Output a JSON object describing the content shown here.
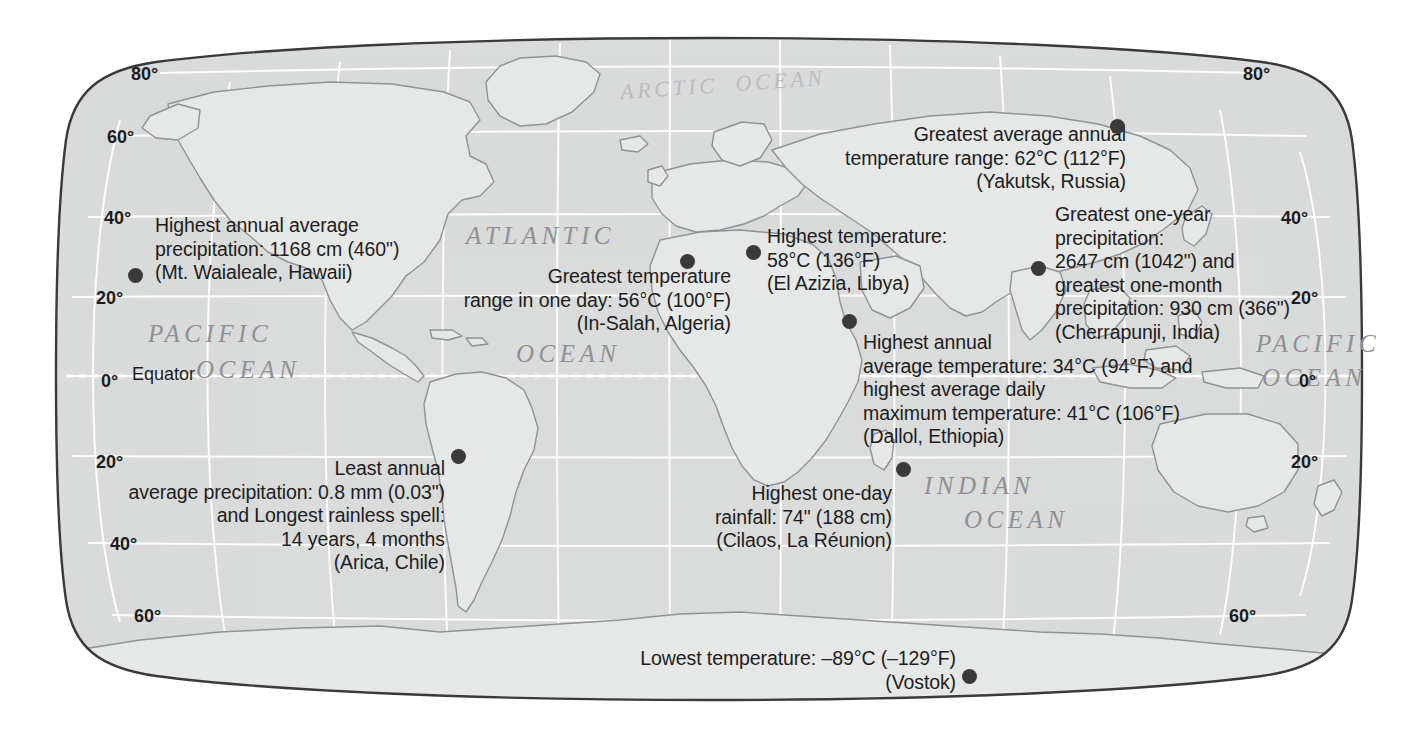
{
  "map": {
    "title": "World Climate Extremes Map",
    "projection": "Robinson",
    "colors": {
      "ocean_fill": "#d7d9da",
      "land_fill": "#e3e4e5",
      "land_stroke": "#9a9da1",
      "graticule": "#ffffff",
      "outline": "#3a3a3a",
      "text": "#1d1d1d",
      "ocean_label": "#8e9195",
      "marker": "#3a3a3a",
      "background": "#ffffff"
    },
    "ocean_labels": [
      {
        "name": "arctic-ocean-label",
        "text": "ARCTIC  OCEAN",
        "x": 620,
        "y": 72,
        "rotate": -4,
        "faint": true,
        "size": "sm"
      },
      {
        "name": "atlantic-ocean-label-line1",
        "text": "ATLANTIC",
        "x": 466,
        "y": 222,
        "rotate": 0,
        "faint": false,
        "size": ""
      },
      {
        "name": "atlantic-ocean-label-line2",
        "text": "OCEAN",
        "x": 516,
        "y": 340,
        "rotate": 0,
        "faint": false,
        "size": ""
      },
      {
        "name": "pacific-ocean-label-line1",
        "text": "PACIFIC",
        "x": 148,
        "y": 320,
        "rotate": 0,
        "faint": false,
        "size": ""
      },
      {
        "name": "pacific-ocean-label-line2",
        "text": "OCEAN",
        "x": 196,
        "y": 356,
        "rotate": 0,
        "faint": false,
        "size": ""
      },
      {
        "name": "pacific-ocean-label-right-line1",
        "text": "PACIFIC",
        "x": 1256,
        "y": 330,
        "rotate": 0,
        "faint": false,
        "size": ""
      },
      {
        "name": "pacific-ocean-label-right-line2",
        "text": "OCEAN",
        "x": 1262,
        "y": 364,
        "rotate": 0,
        "faint": false,
        "size": ""
      },
      {
        "name": "indian-ocean-label-line1",
        "text": "INDIAN",
        "x": 924,
        "y": 472,
        "rotate": 0,
        "faint": false,
        "size": ""
      },
      {
        "name": "indian-ocean-label-line2",
        "text": "OCEAN",
        "x": 964,
        "y": 506,
        "rotate": 0,
        "faint": false,
        "size": ""
      }
    ],
    "latitude_labels": [
      {
        "name": "lat-label-80n-left",
        "text": "80°",
        "x": 131,
        "y": 64
      },
      {
        "name": "lat-label-60n-left",
        "text": "60°",
        "x": 107,
        "y": 127
      },
      {
        "name": "lat-label-40n-left",
        "text": "40°",
        "x": 104,
        "y": 208
      },
      {
        "name": "lat-label-20n-left",
        "text": "20°",
        "x": 96,
        "y": 288
      },
      {
        "name": "lat-label-0-left",
        "text": "0°",
        "x": 101,
        "y": 371
      },
      {
        "name": "lat-label-20s-left",
        "text": "20°",
        "x": 96,
        "y": 452
      },
      {
        "name": "lat-label-40s-left",
        "text": "40°",
        "x": 110,
        "y": 534
      },
      {
        "name": "lat-label-60s-left",
        "text": "60°",
        "x": 134,
        "y": 606
      },
      {
        "name": "lat-label-80n-right",
        "text": "80°",
        "x": 1243,
        "y": 64
      },
      {
        "name": "lat-label-40n-right",
        "text": "40°",
        "x": 1281,
        "y": 208
      },
      {
        "name": "lat-label-20n-right",
        "text": "20°",
        "x": 1291,
        "y": 288
      },
      {
        "name": "lat-label-0-right",
        "text": "0°",
        "x": 1299,
        "y": 371
      },
      {
        "name": "lat-label-20s-right",
        "text": "20°",
        "x": 1291,
        "y": 452
      },
      {
        "name": "lat-label-60s-right",
        "text": "60°",
        "x": 1229,
        "y": 606
      }
    ],
    "equator_label": {
      "name": "equator-label",
      "text": "Equator",
      "x": 132,
      "y": 364
    },
    "markers": [
      {
        "name": "marker-mt-waialeale",
        "x": 135,
        "y": 275
      },
      {
        "name": "marker-arica-chile",
        "x": 458,
        "y": 456
      },
      {
        "name": "marker-in-salah-algeria",
        "x": 687,
        "y": 261
      },
      {
        "name": "marker-el-azizia-libya",
        "x": 753,
        "y": 252
      },
      {
        "name": "marker-dallol-ethiopia",
        "x": 849,
        "y": 321
      },
      {
        "name": "marker-cilaos-la-reunion",
        "x": 903,
        "y": 469
      },
      {
        "name": "marker-yakutsk-russia",
        "x": 1117,
        "y": 126
      },
      {
        "name": "marker-cherrapunji-india",
        "x": 1038,
        "y": 268
      },
      {
        "name": "marker-vostok",
        "x": 969,
        "y": 676
      }
    ],
    "annotations": [
      {
        "name": "annotation-mt-waialeale",
        "align": "left",
        "x": 155,
        "y": 214,
        "lines": [
          "Highest annual average",
          "precipitation: 1168 cm (460\")",
          "(Mt. Waialeale, Hawaii)"
        ]
      },
      {
        "name": "annotation-in-salah",
        "align": "right",
        "x": 431,
        "y": 265,
        "width": 300,
        "lines": [
          "Greatest temperature",
          "range in one day: 56°C (100°F)",
          "(In-Salah, Algeria)"
        ]
      },
      {
        "name": "annotation-el-azizia",
        "align": "left",
        "x": 767,
        "y": 225,
        "lines": [
          "Highest temperature:",
          "58°C (136°F)",
          "(El Azizia, Libya)"
        ]
      },
      {
        "name": "annotation-yakutsk",
        "align": "right",
        "x": 836,
        "y": 123,
        "width": 290,
        "lines": [
          "Greatest average annual",
          "temperature range: 62°C (112°F)",
          "(Yakutsk, Russia)"
        ]
      },
      {
        "name": "annotation-cherrapunji",
        "align": "left",
        "x": 1055,
        "y": 203,
        "lines": [
          "Greatest one-year",
          "precipitation:",
          "2647 cm (1042\") and",
          "greatest one-month",
          "precipitation: 930 cm (366\")",
          "(Cherrapunji, India)"
        ]
      },
      {
        "name": "annotation-dallol",
        "align": "left",
        "x": 863,
        "y": 331,
        "lines": [
          "Highest annual",
          "average temperature: 34°C (94°F) and",
          "highest average daily",
          "maximum temperature: 41°C (106°F)",
          "(Dallol, Ethiopia)"
        ]
      },
      {
        "name": "annotation-arica",
        "align": "right",
        "x": 90,
        "y": 457,
        "width": 355,
        "lines": [
          "Least annual",
          "average precipitation: 0.8 mm (0.03\")",
          "and Longest rainless spell:",
          "14 years, 4 months",
          "(Arica, Chile)"
        ]
      },
      {
        "name": "annotation-cilaos",
        "align": "right",
        "x": 620,
        "y": 482,
        "width": 272,
        "lines": [
          "Highest one-day",
          "rainfall: 74\" (188 cm)",
          "(Cilaos, La Réunion)"
        ]
      },
      {
        "name": "annotation-vostok",
        "align": "right",
        "x": 556,
        "y": 647,
        "width": 400,
        "lines": [
          "Lowest temperature: –89°C (–129°F)",
          "(Vostok)"
        ]
      }
    ]
  }
}
